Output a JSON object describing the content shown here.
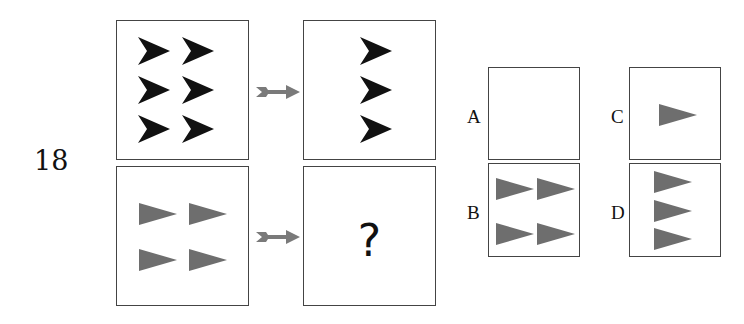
{
  "question": {
    "number": "18",
    "missing_symbol": "?"
  },
  "colors": {
    "chevron": "#111111",
    "triangle": "#6e6e6e",
    "arrow": "#7a7a7a",
    "border": "#444444"
  },
  "rows": [
    {
      "left": {
        "shape": "chevron",
        "count": 6,
        "layout": "3 rows x 2 cols"
      },
      "right": {
        "shape": "chevron",
        "count": 3,
        "layout": "3 rows x 1 col"
      }
    },
    {
      "left": {
        "shape": "triangle",
        "count": 4,
        "layout": "2 rows x 2 cols"
      },
      "right": {
        "shape": "unknown",
        "content": "?"
      }
    }
  ],
  "options": [
    {
      "label": "A",
      "shape": "none",
      "count": 0
    },
    {
      "label": "B",
      "shape": "triangle",
      "count": 4,
      "layout": "2 rows x 2 cols"
    },
    {
      "label": "C",
      "shape": "triangle",
      "count": 1
    },
    {
      "label": "D",
      "shape": "triangle",
      "count": 3,
      "layout": "3 rows x 1 col"
    }
  ]
}
